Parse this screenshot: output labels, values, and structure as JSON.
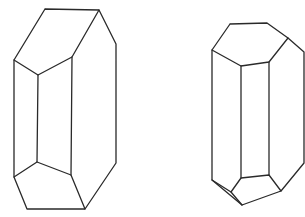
{
  "figure": {
    "stroke_color": "#2a2a2a",
    "background": "#ffffff",
    "crystals": [
      {
        "name": "left-crystal",
        "polylines": [
          [
            [
              45,
              9
            ],
            [
              99,
              10
            ],
            [
              116,
              44
            ],
            [
              116,
              163
            ],
            [
              85,
              209
            ],
            [
              27,
              209
            ],
            [
              14,
              177
            ],
            [
              14,
              60
            ],
            [
              45,
              9
            ]
          ],
          [
            [
              14,
              60
            ],
            [
              38,
              75
            ],
            [
              72,
              57
            ],
            [
              99,
              10
            ]
          ],
          [
            [
              38,
              75
            ],
            [
              37,
              162
            ]
          ],
          [
            [
              72,
              57
            ],
            [
              71,
              175
            ]
          ],
          [
            [
              14,
              177
            ],
            [
              37,
              162
            ],
            [
              71,
              175
            ],
            [
              85,
              209
            ]
          ]
        ]
      },
      {
        "name": "right-crystal",
        "polylines": [
          [
            [
              230,
              24
            ],
            [
              267,
              23
            ],
            [
              288,
              38
            ],
            [
              304,
              52
            ],
            [
              304,
              163
            ],
            [
              281,
              191
            ],
            [
              242,
              205
            ],
            [
              231,
              192
            ],
            [
              212,
              180
            ],
            [
              212,
              50
            ],
            [
              230,
              24
            ]
          ],
          [
            [
              212,
              50
            ],
            [
              241,
              66
            ],
            [
              269,
              62
            ],
            [
              288,
              38
            ]
          ],
          [
            [
              241,
              66
            ],
            [
              241,
              178
            ]
          ],
          [
            [
              269,
              62
            ],
            [
              269,
              175
            ]
          ],
          [
            [
              231,
              192
            ],
            [
              241,
              178
            ],
            [
              269,
              175
            ],
            [
              281,
              191
            ]
          ],
          [
            [
              212,
              180
            ],
            [
              242,
              205
            ]
          ]
        ]
      }
    ]
  }
}
